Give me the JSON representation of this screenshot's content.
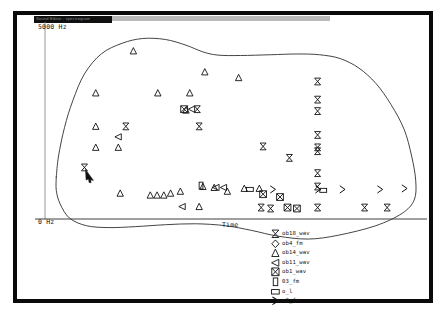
{
  "window": {
    "titlebar_text": "Sound Editor - spectrogram",
    "frame_color": "#0a0a0a",
    "background": "#ffffff"
  },
  "axes": {
    "y_max_label": "5000 Hz",
    "y_min_label": "0 Hz",
    "x_label": "Time",
    "y_axis_name": "Frequency",
    "y_range_hz": [
      0,
      5000
    ]
  },
  "legend": {
    "entries": [
      {
        "symbol": "bowtie",
        "label": "ob18_wav"
      },
      {
        "symbol": "diamond",
        "label": "ob4_fm"
      },
      {
        "symbol": "triangle-up",
        "label": "ob14_wav"
      },
      {
        "symbol": "triangle-left",
        "label": "ob11_wav"
      },
      {
        "symbol": "bowtie-x",
        "label": "ob1_wav"
      },
      {
        "symbol": "rect-tall",
        "label": "03_fm"
      },
      {
        "symbol": "rect-wide",
        "label": "o_l"
      },
      {
        "symbol": "chevron-right",
        "label": "o2_fm"
      }
    ]
  },
  "chart_data": {
    "type": "scatter",
    "title": "",
    "xlabel": "Time",
    "ylabel": "5000 Hz",
    "xlim": [
      0,
      100
    ],
    "ylim": [
      0,
      100
    ],
    "grid": false,
    "legend_position": "bottom-center",
    "contour_note": "hand-drawn closed boundary curve enclosing all points",
    "contour_points": [
      [
        3.0,
        22.0
      ],
      [
        3.6,
        33.0
      ],
      [
        5.2,
        48.0
      ],
      [
        7.4,
        62.0
      ],
      [
        10.5,
        76.0
      ],
      [
        15.0,
        86.5
      ],
      [
        20.5,
        92.0
      ],
      [
        26.0,
        94.5
      ],
      [
        32.0,
        94.0
      ],
      [
        37.5,
        91.0
      ],
      [
        42.0,
        87.5
      ],
      [
        46.0,
        85.8
      ],
      [
        52.0,
        85.6
      ],
      [
        60.0,
        86.0
      ],
      [
        67.0,
        86.4
      ],
      [
        73.0,
        86.0
      ],
      [
        78.5,
        84.0
      ],
      [
        83.5,
        79.0
      ],
      [
        88.0,
        71.0
      ],
      [
        92.0,
        60.0
      ],
      [
        95.5,
        47.0
      ],
      [
        97.5,
        33.0
      ],
      [
        98.6,
        20.0
      ],
      [
        98.2,
        10.0
      ],
      [
        95.0,
        3.0
      ],
      [
        88.0,
        -3.5
      ],
      [
        78.0,
        -8.5
      ],
      [
        70.0,
        -10.5
      ],
      [
        62.0,
        -9.0
      ],
      [
        55.0,
        -6.0
      ],
      [
        48.0,
        -3.5
      ],
      [
        40.0,
        -2.5
      ],
      [
        32.0,
        -3.0
      ],
      [
        24.0,
        -4.0
      ],
      [
        17.0,
        -4.5
      ],
      [
        11.0,
        -3.5
      ],
      [
        6.5,
        0.5
      ],
      [
        4.0,
        8.0
      ],
      [
        3.0,
        15.0
      ],
      [
        3.0,
        22.0
      ]
    ],
    "series": [
      {
        "name": "ob14_wav",
        "symbol": "triangle-up",
        "points": [
          [
            23.5,
            88.0
          ],
          [
            13.5,
            66.0
          ],
          [
            30.0,
            66.0
          ],
          [
            38.5,
            66.0
          ],
          [
            42.5,
            77.0
          ],
          [
            51.5,
            74.0
          ],
          [
            13.5,
            48.5
          ],
          [
            37.5,
            57.0
          ],
          [
            13.5,
            37.5
          ],
          [
            19.5,
            37.5
          ],
          [
            20.0,
            13.5
          ],
          [
            28.0,
            12.5
          ],
          [
            29.8,
            12.5
          ],
          [
            31.6,
            12.5
          ],
          [
            33.4,
            13.5
          ],
          [
            36.0,
            14.5
          ],
          [
            42.0,
            17.0
          ],
          [
            45.0,
            16.5
          ],
          [
            48.5,
            14.5
          ],
          [
            53.0,
            16.0
          ],
          [
            57.0,
            16.0
          ],
          [
            41.0,
            6.5
          ]
        ]
      },
      {
        "name": "ob11_wav",
        "symbol": "triangle-left",
        "points": [
          [
            19.5,
            43.0
          ],
          [
            39.0,
            57.5
          ],
          [
            45.5,
            16.5
          ],
          [
            47.5,
            16.5
          ],
          [
            36.5,
            6.5
          ]
        ]
      },
      {
        "name": "ob1_wav",
        "symbol": "bowtie-x",
        "points": [
          [
            37.0,
            57.5
          ],
          [
            58.0,
            13.0
          ],
          [
            62.5,
            11.5
          ],
          [
            64.5,
            6.0
          ],
          [
            67.0,
            5.5
          ]
        ]
      },
      {
        "name": "ob18_wav",
        "symbol": "bowtie",
        "points": [
          [
            72.5,
            72.0
          ],
          [
            72.5,
            62.5
          ],
          [
            72.5,
            56.5
          ],
          [
            72.5,
            44.0
          ],
          [
            72.5,
            37.5
          ],
          [
            72.5,
            35.5
          ],
          [
            72.5,
            24.0
          ],
          [
            72.5,
            17.0
          ],
          [
            72.5,
            6.0
          ],
          [
            58.0,
            38.0
          ],
          [
            65.0,
            32.0
          ],
          [
            21.5,
            48.5
          ],
          [
            41.0,
            48.5
          ],
          [
            40.5,
            57.5
          ],
          [
            10.5,
            27.0
          ],
          [
            57.5,
            6.0
          ],
          [
            60.0,
            5.5
          ],
          [
            85.0,
            6.0
          ],
          [
            91.0,
            6.0
          ]
        ]
      },
      {
        "name": "03_fm",
        "symbol": "rect-tall",
        "points": [
          [
            41.5,
            17.5
          ]
        ]
      },
      {
        "name": "o_l",
        "symbol": "rect-wide",
        "points": [
          [
            54.5,
            15.5
          ],
          [
            74.0,
            15.0
          ]
        ]
      },
      {
        "name": "o2_fm",
        "symbol": "chevron-right",
        "points": [
          [
            60.5,
            15.5
          ],
          [
            72.5,
            15.5
          ],
          [
            79.0,
            15.5
          ],
          [
            89.0,
            15.5
          ],
          [
            95.5,
            16.0
          ]
        ]
      }
    ],
    "cursor_annotation": {
      "type": "arrow-pointer",
      "x": 10.5,
      "y": 27.0,
      "note": "mouse cursor arrow pointing at leftmost bowtie marker"
    }
  }
}
